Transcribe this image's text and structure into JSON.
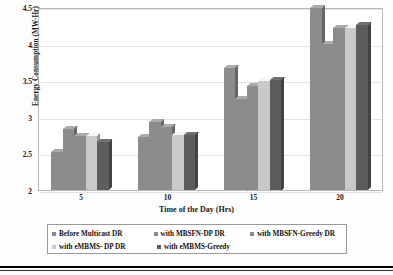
{
  "chart_data": {
    "type": "bar",
    "title": "",
    "xlabel": "Time of the Day (Hrs)",
    "ylabel": "Energy Consumption (MW-Hr)",
    "categories": [
      "5",
      "10",
      "15",
      "20"
    ],
    "ylim": [
      2,
      4.5
    ],
    "yticks": [
      "2",
      "2.5",
      "3",
      "3.5",
      "4",
      "4.5"
    ],
    "ytick_values": [
      2,
      2.5,
      3,
      3.5,
      4,
      4.5
    ],
    "grid": true,
    "legend_position": "bottom",
    "series": [
      {
        "name": "Before Multicast DR",
        "color": "#8c8c8c",
        "values": [
          2.52,
          2.73,
          3.67,
          4.49
        ]
      },
      {
        "name": "with MBSFN-DP DR",
        "color": "#8c8c8c",
        "values": [
          2.84,
          2.93,
          3.25,
          4.0
        ]
      },
      {
        "name": "with MBSFN-Greedy DR",
        "color": "#8c8c8c",
        "values": [
          2.74,
          2.86,
          3.42,
          4.21
        ]
      },
      {
        "name": "with eMBMS- DP DR",
        "color": "#c9c9c9",
        "values": [
          2.74,
          2.75,
          3.49,
          4.21
        ]
      },
      {
        "name": "with eMBMS-Greedy",
        "color": "#5c5c5c",
        "values": [
          2.65,
          2.75,
          3.51,
          4.26
        ]
      }
    ]
  },
  "axes": {
    "y_title": "Energy Consumption (MW-Hr)",
    "x_title": "Time of the Day (Hrs)",
    "y_tick_labels": [
      "4.5",
      "4",
      "3.5",
      "3",
      "2.5",
      "2"
    ],
    "x_tick_labels": [
      "5",
      "10",
      "15",
      "20"
    ]
  },
  "legend": {
    "row1": [
      {
        "label": "Before Multicast DR",
        "color": "#8c8c8c"
      },
      {
        "label": "with MBSFN-DP DR",
        "color": "#8c8c8c"
      },
      {
        "label": "with MBSFN-Greedy DR",
        "color": "#8c8c8c"
      }
    ],
    "row2": [
      {
        "label": "with eMBMS- DP DR",
        "color": "#c9c9c9"
      },
      {
        "label": "with eMBMS-Greedy",
        "color": "#5c5c5c"
      }
    ]
  },
  "colors": {
    "series_medium": "#8c8c8c",
    "series_light": "#c9c9c9",
    "series_dark": "#5c5c5c",
    "gridline": "#e3e3e3",
    "frame": "#b9b9b9",
    "text": "#1a1a1a"
  }
}
